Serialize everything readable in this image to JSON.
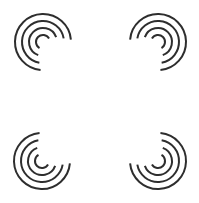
{
  "canvas": {
    "width": 199,
    "height": 203,
    "background": "#ffffff"
  },
  "style": {
    "stroke_color": "#2e2e2e",
    "stroke_width": 2
  },
  "icons": [
    {
      "name": "concentric-arcs-icon-top-left",
      "orientation": "open-bottom-right",
      "center": [
        43,
        42
      ],
      "radii": [
        28,
        21,
        14,
        7
      ],
      "start_deg": [
        95,
        100,
        110,
        120
      ],
      "end_deg": [
        355,
        350,
        340,
        330
      ]
    },
    {
      "name": "concentric-arcs-icon-top-right",
      "orientation": "open-bottom-left",
      "center": [
        158,
        42
      ],
      "radii": [
        28,
        21,
        14,
        7
      ],
      "start_deg": [
        185,
        190,
        200,
        210
      ],
      "end_deg": [
        445,
        440,
        430,
        420
      ]
    },
    {
      "name": "concentric-arcs-icon-bottom-left",
      "orientation": "open-top-right",
      "center": [
        42,
        161
      ],
      "radii": [
        28,
        21,
        14,
        7
      ],
      "start_deg": [
        5,
        10,
        20,
        30
      ],
      "end_deg": [
        265,
        260,
        250,
        240
      ]
    },
    {
      "name": "concentric-arcs-icon-bottom-right",
      "orientation": "open-top-left",
      "center": [
        158,
        161
      ],
      "radii": [
        28,
        21,
        14,
        7
      ],
      "start_deg": [
        -85,
        -80,
        -70,
        -60
      ],
      "end_deg": [
        175,
        170,
        160,
        150
      ]
    }
  ]
}
